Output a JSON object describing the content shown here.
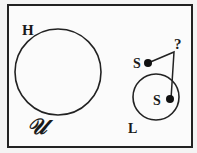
{
  "diagram": {
    "type": "set-diagram",
    "colors": {
      "background": "#f4f4f4",
      "frame_fill": "#fbfbfb",
      "stroke": "#222222",
      "text": "#1a1a1a"
    },
    "universe": {
      "label": "𝒰"
    },
    "sets": [
      {
        "id": "H",
        "label": "H"
      },
      {
        "id": "L",
        "label": "L"
      }
    ],
    "points": [
      {
        "id": "s_outside",
        "label": "S",
        "location": "outside L"
      },
      {
        "id": "s_inside",
        "label": "S",
        "location": "inside L"
      }
    ],
    "connector": {
      "label": "?",
      "connects": [
        "s_outside",
        "s_inside"
      ]
    }
  }
}
